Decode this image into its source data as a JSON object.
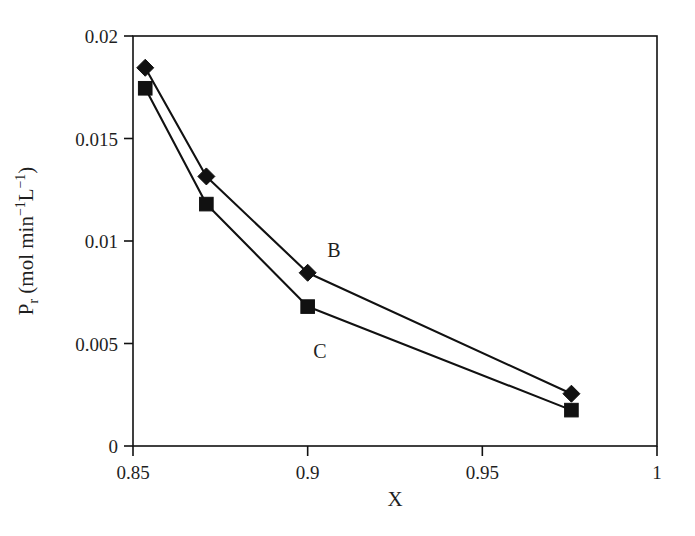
{
  "chart_data": {
    "type": "line",
    "title": "",
    "subtitle": "",
    "xlabel": "X",
    "ylabel_parts": {
      "symbol": "P",
      "symbol_sub": "r",
      "units_prefix": " (mol min",
      "units_exp1": "−1",
      "units_mid": "L",
      "units_exp2": "−1",
      "units_suffix": ")"
    },
    "ylabel": "Pr (mol min−1L−1)",
    "xlim": [
      0.85,
      1.0
    ],
    "ylim": [
      0,
      0.02
    ],
    "xticks": [
      0.85,
      0.9,
      0.95,
      1
    ],
    "xtick_labels": [
      "0.85",
      "0.9",
      "0.95",
      "1"
    ],
    "yticks": [
      0,
      0.005,
      0.01,
      0.015,
      0.02
    ],
    "ytick_labels": [
      "0",
      "0.005",
      "0.01",
      "0.015",
      "0.02"
    ],
    "grid": false,
    "legend_position": "inline-annotation",
    "frame": "box",
    "line_color": "#111111",
    "marker_color": "#111111",
    "series": [
      {
        "name": "B",
        "marker": "diamond",
        "label_x": 0.9075,
        "label_y": 0.00955,
        "x": [
          0.8535,
          0.871,
          0.9,
          0.9755
        ],
        "y": [
          0.01845,
          0.01315,
          0.00845,
          0.00255
        ]
      },
      {
        "name": "C",
        "marker": "square",
        "label_x": 0.9035,
        "label_y": 0.00465,
        "x": [
          0.8535,
          0.871,
          0.9,
          0.9755
        ],
        "y": [
          0.01745,
          0.0118,
          0.0068,
          0.00175
        ]
      }
    ],
    "annotations": [
      {
        "text": "B",
        "series": "B"
      },
      {
        "text": "C",
        "series": "C"
      }
    ]
  }
}
